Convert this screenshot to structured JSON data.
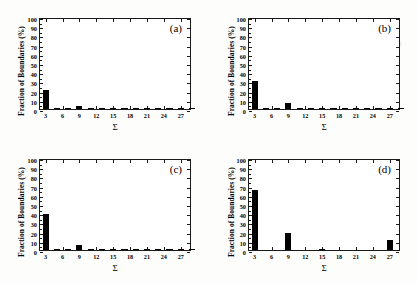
{
  "figure": {
    "panels": [
      {
        "tag": "(a)",
        "ylabel": "Fraction of Boundaries (%)",
        "xlabel": "Σ"
      },
      {
        "tag": "(b)",
        "ylabel": "Fraction of Boundaries (%)",
        "xlabel": "Σ"
      },
      {
        "tag": "(c)",
        "ylabel": "Fraction of Boundaries (%)",
        "xlabel": "Σ"
      },
      {
        "tag": "(d)",
        "ylabel": "Fraction of Boundaries (%)",
        "xlabel": "Σ"
      }
    ],
    "yticks": [
      "0",
      "10",
      "20",
      "30",
      "40",
      "50",
      "60",
      "70",
      "80",
      "90",
      "100"
    ],
    "xticks": [
      "3",
      "6",
      "9",
      "12",
      "15",
      "18",
      "21",
      "24",
      "27"
    ],
    "bar_color": "#000000",
    "axis_color": "#1a1a1a"
  },
  "chart_data": [
    {
      "type": "bar",
      "title": "(a)",
      "xlabel": "Σ",
      "ylabel": "Fraction of Boundaries (%)",
      "ylim": [
        0,
        100
      ],
      "xlim": [
        2,
        29
      ],
      "yticks": [
        0,
        10,
        20,
        30,
        40,
        50,
        60,
        70,
        80,
        90,
        100
      ],
      "xticks": [
        3,
        6,
        9,
        12,
        15,
        18,
        21,
        24,
        27
      ],
      "grid": false,
      "legend": "none",
      "categories": [
        3,
        5,
        7,
        9,
        11,
        13,
        15,
        17,
        19,
        21,
        23,
        25,
        27,
        29
      ],
      "values": [
        21.0,
        0.8,
        1.3,
        3.0,
        0.7,
        0.6,
        0.3,
        0.4,
        0.4,
        1.0,
        0.3,
        0.3,
        0.8,
        0.2
      ]
    },
    {
      "type": "bar",
      "title": "(b)",
      "xlabel": "Σ",
      "ylabel": "Fraction of Boundaries (%)",
      "ylim": [
        0,
        100
      ],
      "xlim": [
        2,
        29
      ],
      "yticks": [
        0,
        10,
        20,
        30,
        40,
        50,
        60,
        70,
        80,
        90,
        100
      ],
      "xticks": [
        3,
        6,
        9,
        12,
        15,
        18,
        21,
        24,
        27
      ],
      "grid": false,
      "legend": "none",
      "categories": [
        3,
        5,
        7,
        9,
        11,
        13,
        15,
        17,
        19,
        21,
        23,
        25,
        27,
        29
      ],
      "values": [
        30.5,
        0.4,
        0.7,
        6.8,
        0.4,
        0.8,
        0.3,
        0.3,
        0.5,
        0.3,
        0.2,
        0.2,
        1.0,
        0.2
      ]
    },
    {
      "type": "bar",
      "title": "(c)",
      "xlabel": "Σ",
      "ylabel": "Fraction of Boundaries (%)",
      "ylim": [
        0,
        100
      ],
      "xlim": [
        2,
        29
      ],
      "yticks": [
        0,
        10,
        20,
        30,
        40,
        50,
        60,
        70,
        80,
        90,
        100
      ],
      "xticks": [
        3,
        6,
        9,
        12,
        15,
        18,
        21,
        24,
        27
      ],
      "grid": false,
      "legend": "none",
      "categories": [
        3,
        5,
        7,
        9,
        11,
        13,
        15,
        17,
        19,
        21,
        23,
        25,
        27,
        29
      ],
      "values": [
        39.0,
        0.8,
        0.4,
        5.2,
        0.4,
        1.1,
        0.3,
        0.3,
        0.6,
        0.5,
        0.3,
        0.2,
        1.3,
        0.2
      ]
    },
    {
      "type": "bar",
      "title": "(d)",
      "xlabel": "Σ",
      "ylabel": "Fraction of Boundaries (%)",
      "ylim": [
        0,
        100
      ],
      "xlim": [
        2,
        29
      ],
      "yticks": [
        0,
        10,
        20,
        30,
        40,
        50,
        60,
        70,
        80,
        90,
        100
      ],
      "xticks": [
        3,
        6,
        9,
        12,
        15,
        18,
        21,
        24,
        27
      ],
      "grid": false,
      "legend": "none",
      "categories": [
        3,
        5,
        7,
        9,
        11,
        13,
        15,
        17,
        19,
        21,
        23,
        25,
        27,
        29
      ],
      "values": [
        65.0,
        0.0,
        0.0,
        19.0,
        0.0,
        0.0,
        0.6,
        0.0,
        0.0,
        0.0,
        0.0,
        0.0,
        11.0,
        0.0
      ]
    }
  ]
}
